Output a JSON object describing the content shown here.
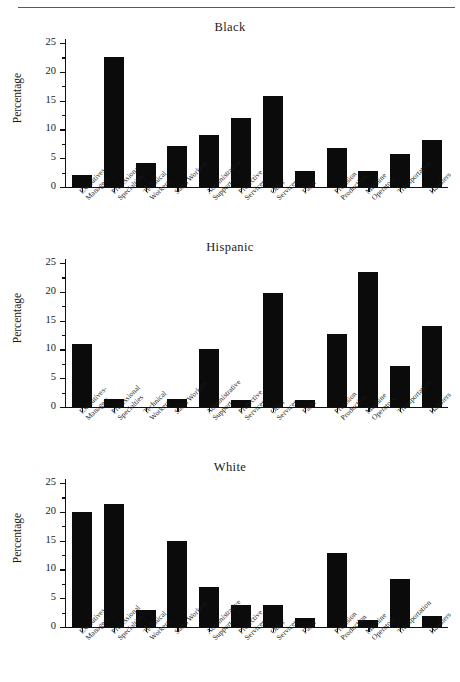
{
  "figure": {
    "ylabel": "Percentage",
    "has_top_rule": true,
    "bar_color": "#0b0b0b",
    "axis_color": "#111111"
  },
  "chart_data": [
    {
      "type": "bar",
      "title": "Black",
      "xlabel": "",
      "ylabel": "Percentage",
      "ylim": [
        0,
        25
      ],
      "yticks": [
        0,
        5,
        10,
        15,
        20,
        25
      ],
      "grid": false,
      "legend": "none",
      "categories": [
        "Executives-\nManagers",
        "Professional\nSpecialties",
        "Technical\nWorkers",
        "Sales Workers",
        "Administrative\nSupport",
        "Protective\nServices",
        "Other\nServices",
        "Farm",
        "Precision\nProduction",
        "Machine\nOperators",
        "Transportation",
        "Handlers"
      ],
      "values": [
        2.0,
        22.6,
        4.2,
        7.1,
        9.0,
        11.9,
        15.8,
        2.7,
        6.7,
        2.8,
        5.8,
        8.1
      ]
    },
    {
      "type": "bar",
      "title": "Hispanic",
      "xlabel": "",
      "ylabel": "Percentage",
      "ylim": [
        0,
        25
      ],
      "yticks": [
        0,
        5,
        10,
        15,
        20,
        25
      ],
      "grid": false,
      "legend": "none",
      "categories": [
        "Executives-\nManagers",
        "Professional\nSpecialties",
        "Technical\nWorkers",
        "Sales Workers",
        "Administrative\nSupport",
        "Protective\nServices",
        "Other\nServices",
        "Farm",
        "Precision\nProduction",
        "Machine\nOperators",
        "Transportation",
        "Handlers"
      ],
      "values": [
        11.0,
        1.4,
        0.0,
        1.4,
        10.0,
        1.2,
        19.8,
        1.2,
        12.7,
        23.5,
        7.1,
        14.0
      ]
    },
    {
      "type": "bar",
      "title": "White",
      "xlabel": "",
      "ylabel": "Percentage",
      "ylim": [
        0,
        25
      ],
      "yticks": [
        0,
        5,
        10,
        15,
        20,
        25
      ],
      "grid": false,
      "legend": "none",
      "categories": [
        "Executives-\nManagers",
        "Professional\nSpecialties",
        "Technical\nWorkers",
        "Sales Workers",
        "Administrative\nSupport",
        "Protective\nServices",
        "Other\nServices",
        "Farm",
        "Precision\nProduction",
        "Machine\nOperators",
        "Transportation",
        "Handlers"
      ],
      "values": [
        19.9,
        21.4,
        3.0,
        14.9,
        7.0,
        3.9,
        3.8,
        1.6,
        12.9,
        1.2,
        8.4,
        1.9
      ]
    }
  ]
}
